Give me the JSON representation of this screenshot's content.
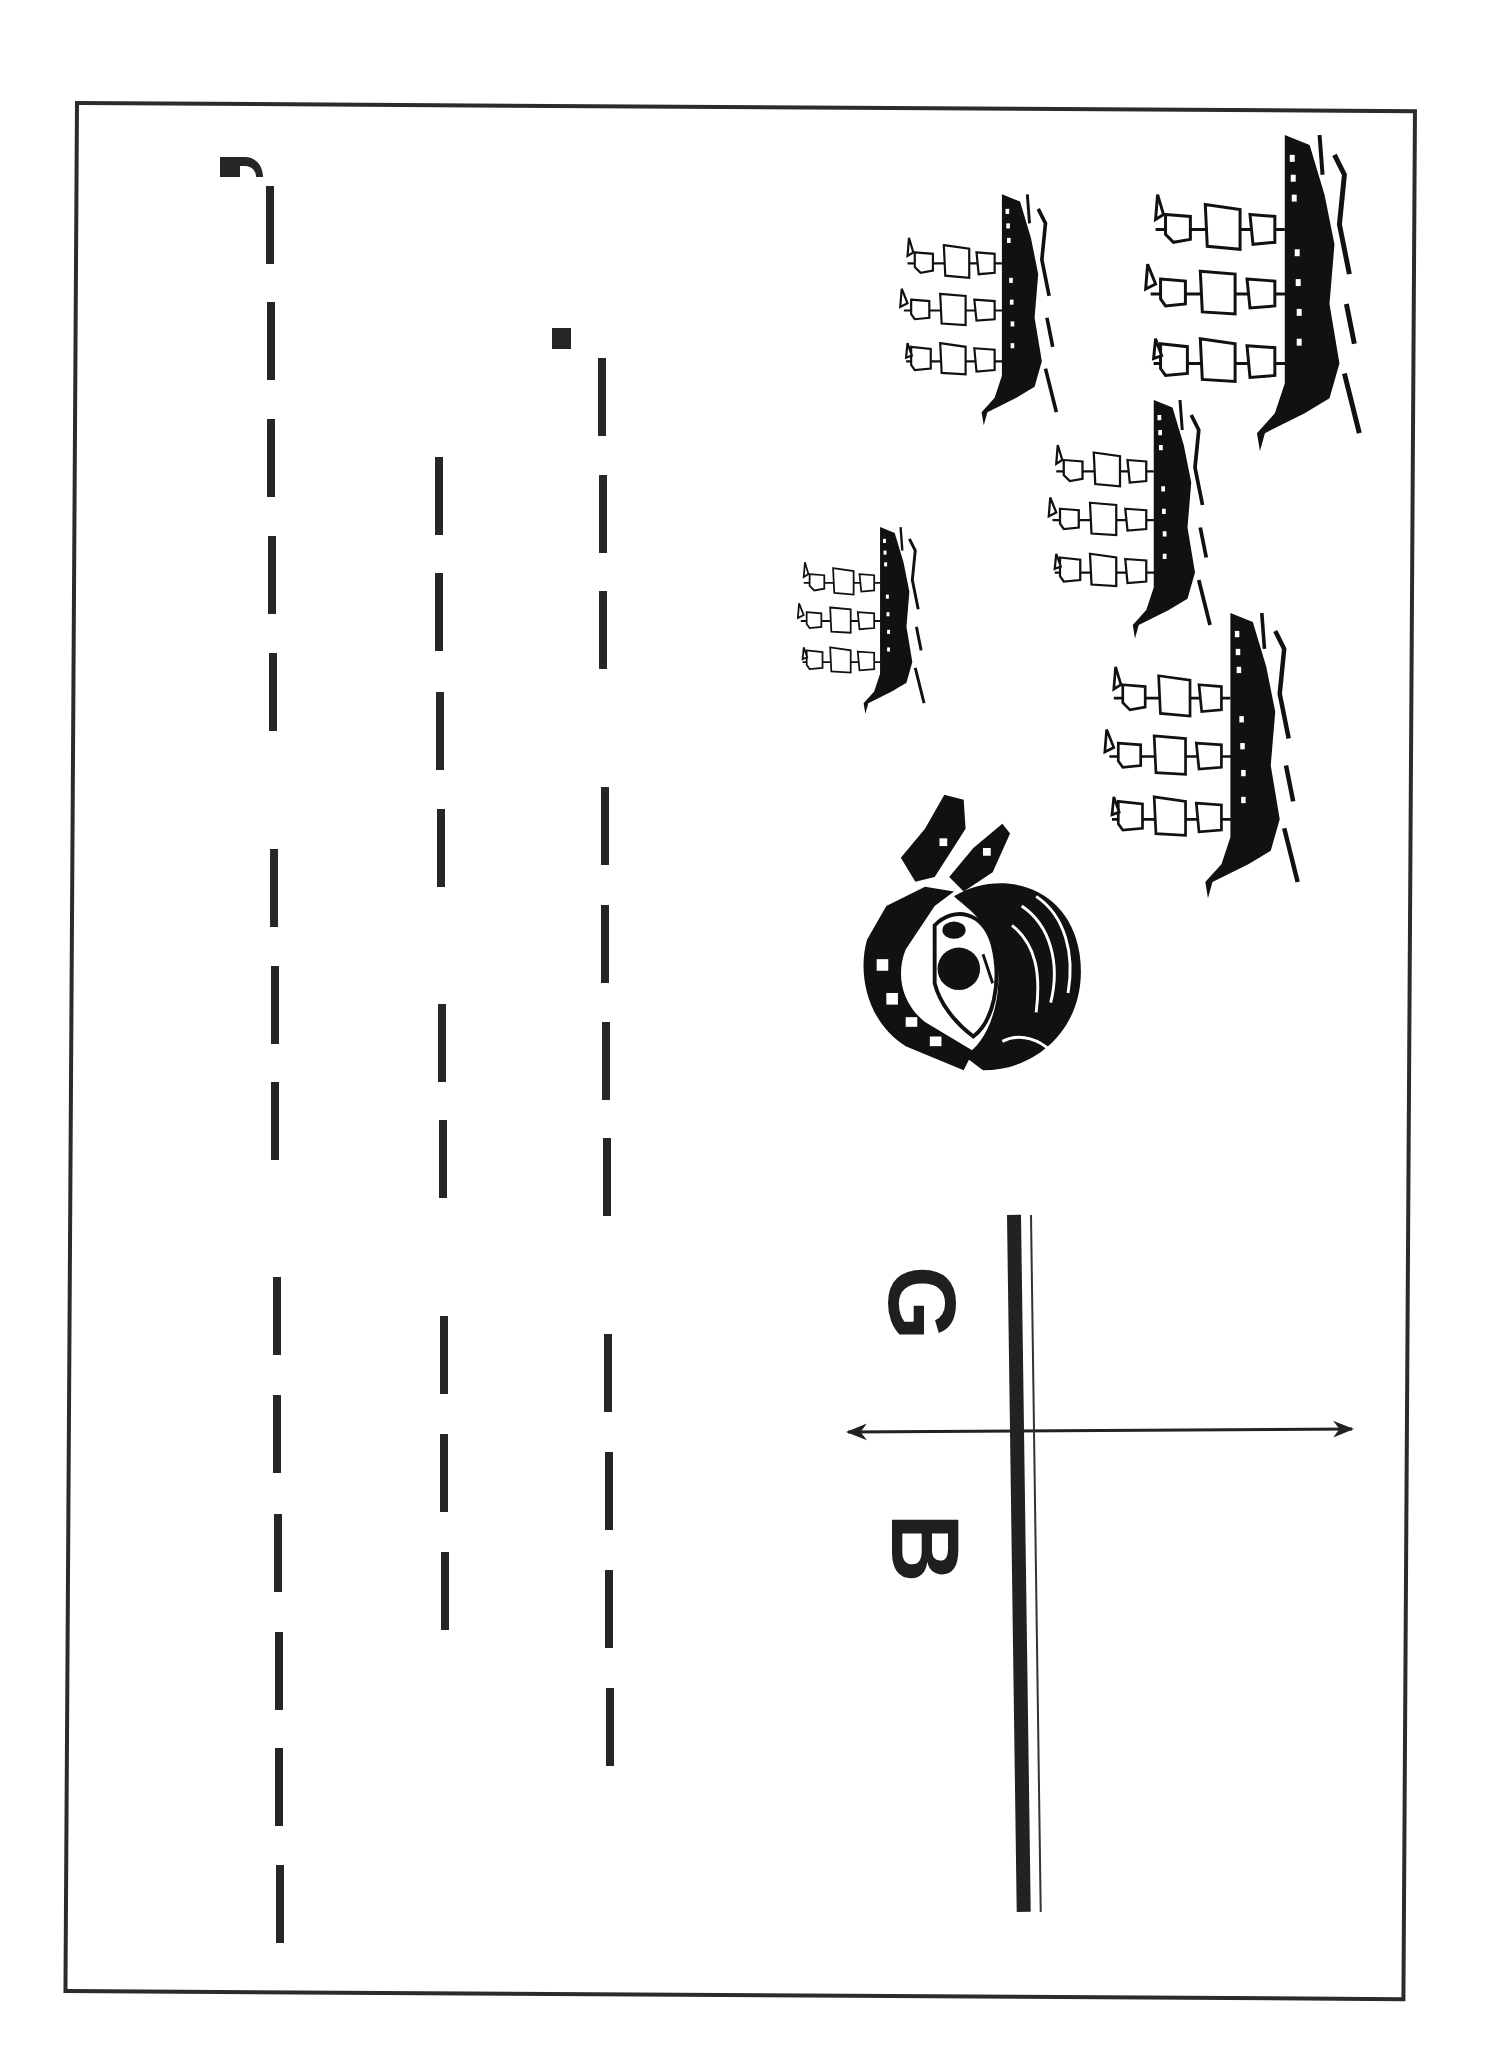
{
  "worksheet": {
    "orientation": "landscape-rotated-90",
    "colors": {
      "ink": "#222222",
      "paper": "#ffffff",
      "frame": "#2b2b2b"
    },
    "frame": {
      "left": 75,
      "top": 101,
      "right": 1411,
      "bottom": 1988
    }
  },
  "tracing": {
    "description": "dashed letter-tracing strokes",
    "lines": [
      {
        "id": "line-1",
        "x": 266,
        "start_mark": "curl",
        "dashes": [
          186,
          302,
          419,
          536,
          653,
          849,
          966,
          1082,
          1277,
          1395,
          1514,
          1632,
          1748,
          1865
        ]
      },
      {
        "id": "line-2",
        "x": 433,
        "start_mark": "none",
        "dashes": [
          457,
          573,
          692,
          809,
          1004,
          1120,
          1316,
          1434,
          1552
        ]
      },
      {
        "id": "line-3",
        "x": 597,
        "start_mark": "square",
        "dashes": [
          358,
          475,
          591,
          787,
          905,
          1022,
          1138,
          1334,
          1452,
          1570,
          1688
        ]
      }
    ]
  },
  "illustrations": {
    "pirate_head": {
      "icon": "pirate-head-icon",
      "box": [
        847,
        790,
        243,
        290
      ]
    },
    "ships": [
      {
        "icon": "pirate-ship-icon",
        "box": [
          893,
          193,
          167,
          235
        ]
      },
      {
        "icon": "pirate-ship-icon",
        "box": [
          1135,
          135,
          230,
          318
        ]
      },
      {
        "icon": "pirate-ship-icon",
        "box": [
          1037,
          400,
          181,
          240
        ]
      },
      {
        "icon": "pirate-ship-icon",
        "box": [
          792,
          520,
          135,
          202
        ]
      },
      {
        "icon": "pirate-ship-icon",
        "box": [
          1088,
          613,
          222,
          287
        ]
      }
    ]
  },
  "label": {
    "left_letter": "G",
    "right_letter": "B",
    "arrow": "double-headed-arrow"
  }
}
